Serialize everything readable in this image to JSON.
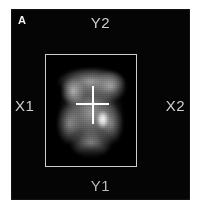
{
  "figure": {
    "panel_label": "A",
    "background_color": "#ffffff",
    "panel_color": "#050505"
  },
  "panel": {
    "axis_labels": {
      "top": "Y2",
      "bottom": "Y1",
      "left": "X1",
      "right": "X2"
    },
    "label_color": "#cfcfcf"
  },
  "roi": {
    "name": "region-of-interest-box",
    "border_color": "#cdcdcd",
    "x": 45,
    "y": 54,
    "width": 92,
    "height": 113
  },
  "cursor": {
    "name": "crosshair-cursor",
    "color": "#ffffff",
    "center_x": 92,
    "center_y": 104
  },
  "scan": {
    "modality_hint": "scintigram",
    "colormap": "grayscale",
    "hotspot_note": "focal high-uptake spot right of cursor"
  }
}
